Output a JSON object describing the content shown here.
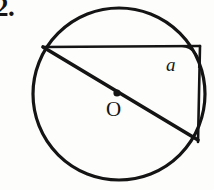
{
  "figure": {
    "problem_number": "2.",
    "background_color": "#fdfdfb",
    "stroke_color": "#141414",
    "labels": {
      "center_point": "O",
      "angle": "a"
    },
    "geometry": {
      "type": "circle-inscribed-angle-diagram",
      "circle": {
        "center_x": 119,
        "center_y": 94,
        "radius": 86,
        "stroke_width": 3.2
      },
      "center_dot": {
        "x": 117,
        "y": 93,
        "radius": 3.6
      },
      "diameter_chord": {
        "x1": 43,
        "y1": 47,
        "x2": 198,
        "y2": 140,
        "stroke_width": 3.6,
        "description": "diameter through O from upper-left chord vertex to lower-right vertex"
      },
      "horizontal_chord": {
        "x1": 43,
        "y1": 47,
        "x2": 200,
        "y2": 46,
        "stroke_width": 2.6,
        "description": "horizontal chord across the top"
      },
      "vertical_chord": {
        "x1": 200,
        "y1": 46,
        "x2": 198,
        "y2": 142,
        "stroke_width": 2.6,
        "description": "vertical chord on the right side"
      },
      "angle_arc": {
        "vertex_x": 200,
        "vertex_y": 46,
        "start_x": 182,
        "start_y": 46,
        "end_x": 199,
        "end_y": 68,
        "radius": 19,
        "stroke_width": 2.2,
        "description": "arc marking the inscribed angle a at the top-right vertex"
      }
    }
  }
}
